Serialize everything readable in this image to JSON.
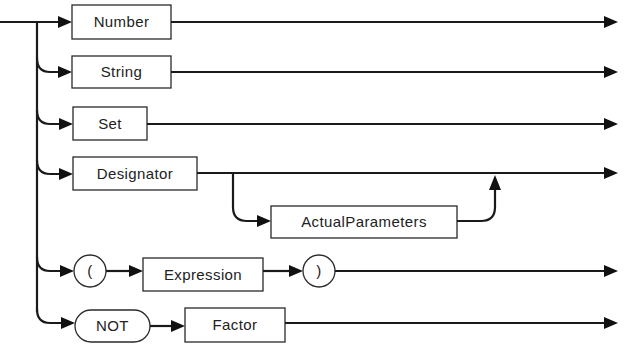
{
  "diagram": {
    "type": "syntax-diagram",
    "production": "Factor",
    "alternatives": [
      {
        "kind": "nonterminal",
        "label": "Number"
      },
      {
        "kind": "nonterminal",
        "label": "String"
      },
      {
        "kind": "nonterminal",
        "label": "Set"
      },
      {
        "kind": "sequence",
        "items": [
          {
            "kind": "nonterminal",
            "label": "Designator"
          },
          {
            "kind": "optional",
            "item": {
              "kind": "nonterminal",
              "label": "ActualParameters"
            }
          }
        ]
      },
      {
        "kind": "sequence",
        "items": [
          {
            "kind": "terminal",
            "label": "("
          },
          {
            "kind": "nonterminal",
            "label": "Expression"
          },
          {
            "kind": "terminal",
            "label": ")"
          }
        ]
      },
      {
        "kind": "sequence",
        "items": [
          {
            "kind": "terminal",
            "label": "NOT"
          },
          {
            "kind": "nonterminal",
            "label": "Factor"
          }
        ]
      }
    ]
  },
  "labels": {
    "number": "Number",
    "string": "String",
    "set": "Set",
    "designator": "Designator",
    "actual_parameters": "ActualParameters",
    "lparen": "(",
    "expression": "Expression",
    "rparen": ")",
    "not": "NOT",
    "factor": "Factor"
  },
  "colors": {
    "line": "#1a1a1a",
    "background": "#ffffff"
  }
}
